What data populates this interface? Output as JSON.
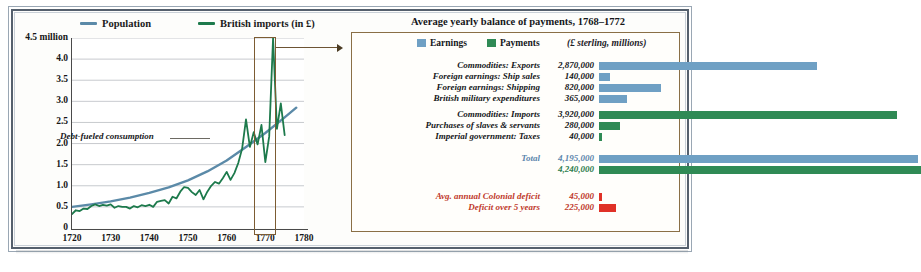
{
  "chart_data": [
    {
      "type": "line",
      "title": "",
      "xlabel": "",
      "ylabel": "",
      "xlim": [
        1720,
        1780
      ],
      "ylim": [
        0,
        4.5
      ],
      "grid": true,
      "legend_position": "top",
      "y_ticks": [
        "4.5 million",
        "4.0",
        "3.5",
        "3.0",
        "2.5",
        "2.0",
        "1.5",
        "1.0",
        "0.5",
        "0"
      ],
      "y_tick_values": [
        4.5,
        4.0,
        3.5,
        3.0,
        2.5,
        2.0,
        1.5,
        1.0,
        0.5,
        0
      ],
      "x_ticks": [
        "1720",
        "1730",
        "1740",
        "1750",
        "1760",
        "1770",
        "1780"
      ],
      "x_tick_values": [
        1720,
        1730,
        1740,
        1750,
        1760,
        1770,
        1780
      ],
      "annotation": "Debt-fueled consumption",
      "highlight_range": [
        1768,
        1772
      ],
      "series": [
        {
          "name": "Population",
          "color": "#5b8aa8",
          "x": [
            1720,
            1725,
            1730,
            1735,
            1740,
            1745,
            1750,
            1755,
            1760,
            1765,
            1770,
            1775,
            1778
          ],
          "values": [
            0.5,
            0.56,
            0.63,
            0.72,
            0.83,
            0.96,
            1.13,
            1.34,
            1.6,
            1.92,
            2.25,
            2.62,
            2.85
          ]
        },
        {
          "name": "British imports (in £)",
          "color": "#1d7a4c",
          "x": [
            1720,
            1721,
            1722,
            1723,
            1724,
            1725,
            1726,
            1727,
            1728,
            1729,
            1730,
            1731,
            1732,
            1733,
            1734,
            1735,
            1736,
            1737,
            1738,
            1739,
            1740,
            1741,
            1742,
            1743,
            1744,
            1745,
            1746,
            1747,
            1748,
            1749,
            1750,
            1751,
            1752,
            1753,
            1754,
            1755,
            1756,
            1757,
            1758,
            1759,
            1760,
            1761,
            1762,
            1763,
            1764,
            1765,
            1766,
            1767,
            1768,
            1769,
            1770,
            1771,
            1772,
            1773,
            1774,
            1775
          ],
          "values": [
            0.33,
            0.42,
            0.4,
            0.46,
            0.45,
            0.52,
            0.56,
            0.52,
            0.55,
            0.53,
            0.56,
            0.48,
            0.52,
            0.5,
            0.5,
            0.46,
            0.52,
            0.49,
            0.54,
            0.52,
            0.55,
            0.5,
            0.62,
            0.64,
            0.66,
            0.58,
            0.74,
            0.7,
            0.86,
            0.97,
            0.95,
            0.85,
            0.78,
            0.9,
            0.68,
            0.86,
            1.0,
            1.09,
            1.05,
            1.18,
            1.33,
            1.14,
            1.3,
            1.54,
            1.88,
            2.57,
            1.92,
            2.27,
            1.98,
            2.44,
            1.56,
            2.17,
            4.5,
            2.35,
            2.95,
            2.2,
            0.3
          ]
        }
      ]
    },
    {
      "type": "bar",
      "title": "Average yearly balance of payments, 1768–1772",
      "unit_note": "(£ sterling, millions)",
      "legend": [
        {
          "label": "Earnings",
          "color": "#6fa0c4"
        },
        {
          "label": "Payments",
          "color": "#2f8a55"
        }
      ],
      "xlabel": "",
      "ylabel": "",
      "max_value": 4240000,
      "groups": [
        {
          "series": "Earnings",
          "rows": [
            {
              "label": "Commodities: Exports",
              "value_text": "2,870,000",
              "value": 2870000
            },
            {
              "label": "Foreign earnings: Ship sales",
              "value_text": "140,000",
              "value": 140000
            },
            {
              "label": "Foreign earnings: Shipping",
              "value_text": "820,000",
              "value": 820000
            },
            {
              "label": "British military expenditures",
              "value_text": "365,000",
              "value": 365000
            }
          ]
        },
        {
          "series": "Payments",
          "rows": [
            {
              "label": "Commodities: Imports",
              "value_text": "3,920,000",
              "value": 3920000
            },
            {
              "label": "Purchases of slaves & servants",
              "value_text": "280,000",
              "value": 280000
            },
            {
              "label": "Imperial government: Taxes",
              "value_text": "40,000",
              "value": 40000
            }
          ]
        },
        {
          "series": "Total",
          "rows": [
            {
              "label": "Total",
              "value_text": "4,195,000",
              "value": 4195000
            },
            {
              "label": "",
              "value_text": "4,240,000",
              "value": 4240000
            }
          ]
        },
        {
          "series": "Deficit",
          "rows": [
            {
              "label": "Avg. annual Colonial deficit",
              "value_text": "45,000",
              "value": 45000
            },
            {
              "label": "Deficit over 5 years",
              "value_text": "225,000",
              "value": 225000
            }
          ]
        }
      ]
    }
  ],
  "left_chart": {
    "legend": [
      {
        "label": "Population",
        "color": "#5b8aa8"
      },
      {
        "label": "British imports (in £)",
        "color": "#1d7a4c"
      }
    ],
    "y_ticks": [
      "4.5 million",
      "4.0",
      "3.5",
      "3.0",
      "2.5",
      "2.0",
      "1.5",
      "1.0",
      "0.5",
      "0"
    ],
    "x_ticks": [
      "1720",
      "1730",
      "1740",
      "1750",
      "1760",
      "1770",
      "1780"
    ],
    "annotation": "Debt-fueled consumption"
  },
  "right_panel": {
    "title": "Average yearly balance of payments, 1768–1772",
    "legend": [
      {
        "label": "Earnings",
        "color": "#6fa0c4"
      },
      {
        "label": "Payments",
        "color": "#2f8a55"
      }
    ],
    "unit_note": "(£ sterling, millions)",
    "rows": [
      {
        "label": "Commodities: Exports",
        "value": "2,870,000"
      },
      {
        "label": "Foreign earnings: Ship sales",
        "value": "140,000"
      },
      {
        "label": "Foreign earnings: Shipping",
        "value": "820,000"
      },
      {
        "label": "British military expenditures",
        "value": "365,000"
      },
      {
        "label": "Commodities: Imports",
        "value": "3,920,000"
      },
      {
        "label": "Purchases of slaves & servants",
        "value": "280,000"
      },
      {
        "label": "Imperial government: Taxes",
        "value": "40,000"
      },
      {
        "label": "Total",
        "value": "4,195,000"
      },
      {
        "label": "",
        "value": "4,240,000"
      },
      {
        "label": "Avg. annual Colonial deficit",
        "value": "45,000"
      },
      {
        "label": "Deficit over 5 years",
        "value": "225,000"
      }
    ]
  },
  "colors": {
    "population_line": "#5b8aa8",
    "imports_line": "#1d7a4c",
    "earnings_bar": "#6fa0c4",
    "payments_bar": "#2f8a55",
    "deficit_bar": "#e03127",
    "fill_tan": "#e8c98f",
    "highlight_border": "#7c5c33",
    "panel_border": "#8a6f46"
  }
}
